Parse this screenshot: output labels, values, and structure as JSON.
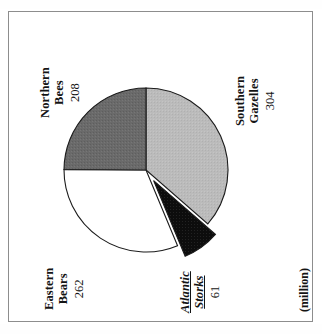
{
  "figure": {
    "unit_label": "(million)",
    "frame": true
  },
  "chart_data": {
    "type": "pie",
    "title": "",
    "subtitle": "",
    "xlabel": "",
    "ylabel": "",
    "unit": "(million)",
    "total": 835,
    "legend_position": "outside-labels",
    "grid": false,
    "rotation_deg": -90,
    "categories": [
      "Southern Gazelles",
      "Atlantic Storks",
      "Eastern Bears",
      "Northern Bees"
    ],
    "values": [
      304,
      262,
      208,
      61
    ],
    "slices": [
      {
        "name": "Southern Gazelles",
        "name_line1": "Southern",
        "name_line2": "Gazelles",
        "value": 304,
        "value_text": "304",
        "percent": 36.4,
        "color": "#b9b9b9",
        "exploded": false,
        "emphasis": "normal"
      },
      {
        "name": "Eastern Bears",
        "name_line1": "Eastern",
        "name_line2": "Bears",
        "value": 262,
        "value_text": "262",
        "percent": 31.4,
        "color": "#ffffff",
        "exploded": false,
        "emphasis": "normal"
      },
      {
        "name": "Northern Bees",
        "name_line1": "Northern",
        "name_line2": "Bees",
        "value": 208,
        "value_text": "208",
        "percent": 24.9,
        "color": "#6a6a6a",
        "exploded": false,
        "emphasis": "normal"
      },
      {
        "name": "Atlantic Storks",
        "name_line1": "Atlantic",
        "name_line2": "Storks",
        "value": 61,
        "value_text": "61",
        "percent": 7.3,
        "color": "#0d0d0d",
        "exploded": true,
        "emphasis": "bold-italic-underline"
      }
    ],
    "colors": {
      "southern_gazelles": "#b9b9b9",
      "eastern_bears": "#ffffff",
      "northern_bees": "#6a6a6a",
      "atlantic_storks": "#0d0d0d",
      "outline": "#1b1b1b",
      "frame": "#8d8d8d"
    }
  }
}
